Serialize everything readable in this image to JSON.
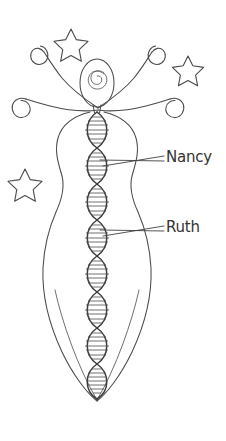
{
  "diagram": {
    "background_color": "#ffffff",
    "ink_color": "#4a4a4a",
    "text_color": "#333333",
    "style": "hand-drawn line art"
  },
  "labels": [
    {
      "id": "nancy",
      "text": "Nancy",
      "x": 166,
      "y": 150
    },
    {
      "id": "ruth",
      "text": "Ruth",
      "x": 166,
      "y": 220
    }
  ],
  "figure": {
    "head": {
      "type": "oval-with-spiral",
      "cx": 97,
      "cy": 83,
      "rx": 17,
      "ry": 24
    },
    "body": {
      "type": "curvy-silhouette-tapering-to-point",
      "top_y": 108,
      "tip_y": 400
    },
    "arms": {
      "count": 4,
      "type": "spiral-tipped-tendrils"
    },
    "helix": {
      "type": "double-helix",
      "lobes": 8,
      "center_x": 97,
      "top_y": 112,
      "bottom_y": 398,
      "width": 26
    }
  },
  "stars": [
    {
      "id": "star-upper-left",
      "cx": 71,
      "cy": 42,
      "r": 13
    },
    {
      "id": "star-upper-right",
      "cx": 188,
      "cy": 68,
      "r": 12
    },
    {
      "id": "star-mid-left",
      "cx": 25,
      "cy": 182,
      "r": 13
    }
  ]
}
